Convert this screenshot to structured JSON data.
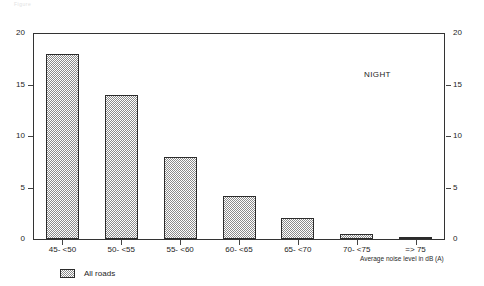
{
  "header": {
    "faint_text": "Figure"
  },
  "annotation": {
    "label": "NIGHT"
  },
  "legend": {
    "swatch_name": "hatched-pattern-swatch",
    "items": [
      {
        "label": "All roads"
      }
    ]
  },
  "axes": {
    "x_title": "Average noise level in dB (A)",
    "y_title": "",
    "y_ticks": [
      "0",
      "5",
      "10",
      "15",
      "20"
    ],
    "y_ticks_right": [
      "0",
      "5",
      "10",
      "15",
      "20"
    ]
  },
  "chart_data": {
    "type": "bar",
    "title": "",
    "subtitle": "",
    "categories": [
      "45- <50",
      "50- <55",
      "55- <60",
      "60- <65",
      "65- <70",
      "70- <75",
      "=> 75"
    ],
    "values": [
      18,
      14,
      8,
      4.2,
      2,
      0.5,
      0.2
    ],
    "series": [
      {
        "name": "All roads",
        "values": [
          18,
          14,
          8,
          4.2,
          2,
          0.5,
          0.2
        ]
      }
    ],
    "xlabel": "Average noise level in dB (A)",
    "ylabel": "",
    "ylim": [
      0,
      20
    ],
    "yticks": [
      0,
      5,
      10,
      15,
      20
    ],
    "grid": false,
    "legend_position": "bottom-left",
    "annotations": [
      "NIGHT"
    ],
    "dual_y_axis": true
  }
}
